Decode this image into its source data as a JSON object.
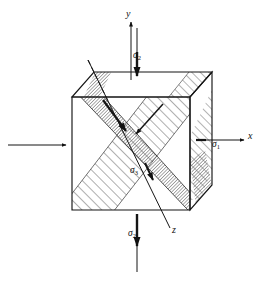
{
  "figure": {
    "type": "engineering-stress-element-diagram",
    "background_color": "#ffffff",
    "line_color": "#1a1a1a",
    "hatch_color": "#555555",
    "shade_color": "#8a8a8a"
  },
  "axes": [
    {
      "id": "y",
      "label": "y",
      "direction": "vertical-up",
      "label_x": 128,
      "label_y": 14
    },
    {
      "id": "x",
      "label": "x",
      "direction": "horizontal-right",
      "label_x": 250,
      "label_y": 137
    },
    {
      "id": "z",
      "label": "z",
      "direction": "diagonal-down-right",
      "label_x": 174,
      "label_y": 231
    }
  ],
  "stress_labels": [
    {
      "id": "sigma-1-right",
      "symbol": "σ",
      "subscript": "1",
      "axis": "x",
      "label_x": 213,
      "label_y": 146
    },
    {
      "id": "sigma-2-top",
      "symbol": "σ",
      "subscript": "2",
      "axis": "y",
      "label_x": 134,
      "label_y": 57
    },
    {
      "id": "sigma-2-bottom",
      "symbol": "σ",
      "subscript": "2",
      "axis": "y",
      "label_x": 129,
      "label_y": 235
    },
    {
      "id": "sigma-3-center",
      "symbol": "σ",
      "subscript": "3",
      "axis": "z",
      "label_x": 131,
      "label_y": 172
    }
  ],
  "cube": {
    "front_face": {
      "left": 72,
      "top": 97,
      "right": 190,
      "bottom": 210
    },
    "depth_offset": {
      "dx": 22,
      "dy": -25
    },
    "visible_faces": [
      "front",
      "top",
      "right"
    ]
  },
  "arrows": [
    {
      "id": "arrow-sigma1-left-inward",
      "from": [
        8,
        145
      ],
      "to": [
        68,
        145
      ],
      "head": "right"
    },
    {
      "id": "arrow-sigma1-right-outward",
      "from": [
        196,
        140
      ],
      "to": [
        240,
        140
      ],
      "head": "right"
    },
    {
      "id": "arrow-sigma2-top-down",
      "from": [
        137,
        20
      ],
      "to": [
        137,
        78
      ],
      "head": "down"
    },
    {
      "id": "arrow-sigma2-bottom-down",
      "from": [
        137,
        270
      ],
      "to": [
        137,
        216
      ],
      "head": "down"
    },
    {
      "id": "arrow-shear-plane-a",
      "from": [
        105,
        100
      ],
      "to": [
        125,
        128
      ],
      "head": "down-right"
    },
    {
      "id": "arrow-shear-plane-b",
      "from": [
        160,
        105
      ],
      "to": [
        133,
        133
      ],
      "head": "down-left"
    },
    {
      "id": "arrow-z-axis",
      "from": [
        88,
        60
      ],
      "to": [
        168,
        228
      ],
      "head": "down-right"
    }
  ],
  "shear_planes": [
    {
      "id": "plane-hatched-up-right",
      "style": "line-hatch-45",
      "direction": "up-right"
    },
    {
      "id": "plane-shaded-down-right",
      "style": "dense-shade",
      "direction": "down-right"
    }
  ]
}
